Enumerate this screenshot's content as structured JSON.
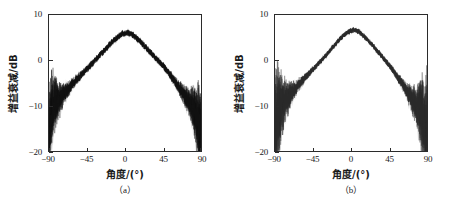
{
  "figure": {
    "background": "#ffffff",
    "axis_color": "#2b2b2b"
  },
  "panels": [
    {
      "caption": "（a）",
      "xlabel": "角度/(°)",
      "ylabel": "增益衰减/dB",
      "trace_color": "#111111",
      "trace_spread_color": "#8f8f8f"
    },
    {
      "caption": "（b）",
      "xlabel": "角度/(°)",
      "ylabel": "增益衰减/dB",
      "trace_color": "#2a2a2a",
      "trace_spread_color": "#9a9a9a"
    }
  ],
  "chart_data": [
    {
      "type": "line",
      "title": "",
      "subtitle": "",
      "panel_label": "（a）",
      "xlabel": "角度/(°)",
      "ylabel": "增益衰减/dB",
      "xlim": [
        -90,
        90
      ],
      "ylim": [
        -20,
        10
      ],
      "xticks": [
        -90,
        -45,
        0,
        45,
        90
      ],
      "xtick_labels": [
        "-90",
        "-45",
        "0",
        "45",
        "90"
      ],
      "yticks": [
        10,
        0,
        -10,
        -20
      ],
      "ytick_labels": [
        "10",
        "0",
        "-10",
        "-20"
      ],
      "grid": false,
      "legend": false,
      "legend_position": "none",
      "noise_amplitude_db": 0.75,
      "noise_amplitude_edge_db": 2.2,
      "peak_value_db": 6.1,
      "peak_angle_deg": 0,
      "series": [
        {
          "name": "增益衰减",
          "x": [
            -90,
            -87,
            -84,
            -81,
            -78,
            -75,
            -72,
            -69,
            -66,
            -63,
            -60,
            -57,
            -54,
            -51,
            -48,
            -45,
            -42,
            -39,
            -36,
            -33,
            -30,
            -27,
            -24,
            -21,
            -18,
            -15,
            -12,
            -9,
            -6,
            -3,
            0,
            3,
            6,
            9,
            12,
            15,
            18,
            21,
            24,
            27,
            30,
            33,
            36,
            39,
            42,
            45,
            48,
            51,
            54,
            57,
            60,
            63,
            66,
            69,
            72,
            75,
            78,
            81,
            84,
            87,
            90
          ],
          "values": [
            -16.8,
            -11.2,
            -9.6,
            -9.2,
            -8.6,
            -8.0,
            -7.3,
            -6.6,
            -6.0,
            -5.4,
            -4.8,
            -4.2,
            -3.6,
            -3.0,
            -2.5,
            -1.9,
            -1.3,
            -0.7,
            -0.1,
            0.5,
            1.1,
            1.7,
            2.3,
            2.9,
            3.5,
            4.1,
            4.6,
            5.1,
            5.5,
            5.9,
            6.0,
            6.1,
            5.9,
            5.6,
            5.2,
            4.7,
            4.2,
            3.6,
            3.0,
            2.4,
            1.8,
            1.2,
            0.6,
            0.0,
            -0.6,
            -1.2,
            -1.9,
            -2.6,
            -3.3,
            -4.1,
            -4.9,
            -5.7,
            -6.5,
            -7.3,
            -8.1,
            -8.9,
            -9.8,
            -10.8,
            -12.0,
            -14.0,
            -17.2
          ]
        }
      ]
    },
    {
      "type": "line",
      "title": "",
      "subtitle": "",
      "panel_label": "（b）",
      "xlabel": "角度/(°)",
      "ylabel": "增益衰减/dB",
      "xlim": [
        -90,
        90
      ],
      "ylim": [
        -20,
        10
      ],
      "xticks": [
        -90,
        -45,
        0,
        45,
        90
      ],
      "xtick_labels": [
        "-90",
        "-45",
        "0",
        "45",
        "90"
      ],
      "yticks": [
        10,
        0,
        -10,
        -20
      ],
      "ytick_labels": [
        "10",
        "0",
        "-10",
        "-20"
      ],
      "grid": false,
      "legend": false,
      "legend_position": "none",
      "noise_amplitude_db": 0.6,
      "noise_amplitude_edge_db": 2.6,
      "peak_value_db": 6.7,
      "peak_angle_deg": 2,
      "series": [
        {
          "name": "增益衰减",
          "x": [
            -90,
            -87,
            -84,
            -81,
            -78,
            -75,
            -72,
            -69,
            -66,
            -63,
            -60,
            -57,
            -54,
            -51,
            -48,
            -45,
            -42,
            -39,
            -36,
            -33,
            -30,
            -27,
            -24,
            -21,
            -18,
            -15,
            -12,
            -9,
            -6,
            -3,
            0,
            3,
            6,
            9,
            12,
            15,
            18,
            21,
            24,
            27,
            30,
            33,
            36,
            39,
            42,
            45,
            48,
            51,
            54,
            57,
            60,
            63,
            66,
            69,
            72,
            75,
            78,
            81,
            84,
            87,
            90
          ],
          "values": [
            -17.4,
            -12.5,
            -10.4,
            -9.6,
            -9.0,
            -8.3,
            -7.6,
            -6.9,
            -6.2,
            -5.6,
            -5.0,
            -4.4,
            -3.8,
            -3.2,
            -2.6,
            -2.0,
            -1.4,
            -0.8,
            -0.2,
            0.4,
            1.0,
            1.7,
            2.4,
            3.0,
            3.7,
            4.3,
            4.9,
            5.4,
            5.9,
            6.3,
            6.5,
            6.7,
            6.6,
            6.3,
            5.9,
            5.4,
            4.8,
            4.2,
            3.6,
            3.0,
            2.3,
            1.7,
            1.0,
            0.3,
            -0.4,
            -1.1,
            -1.8,
            -2.6,
            -3.4,
            -4.2,
            -5.0,
            -5.9,
            -6.8,
            -7.7,
            -8.6,
            -9.4,
            -10.2,
            -11.0,
            -11.9,
            -13.4,
            -17.0
          ]
        }
      ]
    }
  ]
}
